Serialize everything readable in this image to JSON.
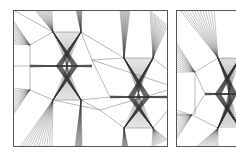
{
  "figure": {
    "colors": {
      "stroke": "#333333",
      "frame": "#555555",
      "background": "#ffffff"
    },
    "panels": [
      {
        "id": "left",
        "frame": [
          13,
          10,
          168,
          147
        ],
        "nodes": [
          {
            "name": "n_top_left_corner_fan",
            "x": 13,
            "y": 24
          },
          {
            "name": "n_a",
            "x": 30,
            "y": 45
          },
          {
            "name": "n_b",
            "x": 53,
            "y": 32
          },
          {
            "name": "n_c",
            "x": 81,
            "y": 32
          },
          {
            "name": "n_d",
            "x": 30,
            "y": 66
          },
          {
            "name": "n_e",
            "x": 92,
            "y": 60
          },
          {
            "name": "n_f",
            "x": 53,
            "y": 100
          },
          {
            "name": "n_g",
            "x": 81,
            "y": 100
          },
          {
            "name": "n_h",
            "x": 30,
            "y": 90
          },
          {
            "name": "n_i",
            "x": 110,
            "y": 97
          },
          {
            "name": "n_j",
            "x": 124,
            "y": 58
          },
          {
            "name": "n_k",
            "x": 153,
            "y": 58
          },
          {
            "name": "n_l",
            "x": 124,
            "y": 128
          },
          {
            "name": "n_m",
            "x": 153,
            "y": 128
          },
          {
            "name": "n_n",
            "x": 168,
            "y": 97
          },
          {
            "name": "n_o",
            "x": 100,
            "y": 110
          }
        ],
        "bowties": [
          {
            "center": [
              67,
              66
            ],
            "top": [
              [
                53,
                32
              ],
              [
                81,
                32
              ]
            ],
            "bottom": [
              [
                53,
                100
              ],
              [
                81,
                100
              ]
            ],
            "bar": [
              [
                30,
                66
              ],
              [
                92,
                66
              ]
            ]
          },
          {
            "center": [
              139,
              97
            ],
            "top": [
              [
                124,
                58
              ],
              [
                153,
                58
              ]
            ],
            "bottom": [
              [
                124,
                128
              ],
              [
                153,
                128
              ]
            ],
            "bar": [
              [
                110,
                97
              ],
              [
                168,
                97
              ]
            ]
          }
        ],
        "fans": [
          {
            "apex": [
              53,
              32
            ],
            "from": [
              [
                35,
                10
              ],
              [
                52,
                10
              ]
            ]
          },
          {
            "apex": [
              81,
              32
            ],
            "from": [
              [
                76,
                10
              ],
              [
                82,
                10
              ]
            ]
          },
          {
            "apex": [
              30,
              45
            ],
            "from": [
              [
                13,
                20
              ],
              [
                13,
                44
              ]
            ]
          },
          {
            "apex": [
              124,
              58
            ],
            "from": [
              [
                120,
                10
              ],
              [
                130,
                10
              ]
            ]
          },
          {
            "apex": [
              153,
              58
            ],
            "from": [
              [
                150,
                10
              ],
              [
                168,
                25
              ]
            ]
          },
          {
            "apex": [
              53,
              100
            ],
            "from": [
              [
                20,
                147
              ],
              [
                52,
                147
              ]
            ]
          },
          {
            "apex": [
              81,
              100
            ],
            "from": [
              [
                75,
                147
              ],
              [
                82,
                147
              ]
            ]
          },
          {
            "apex": [
              30,
              90
            ],
            "from": [
              [
                13,
                88
              ],
              [
                13,
                115
              ]
            ]
          },
          {
            "apex": [
              124,
              128
            ],
            "from": [
              [
                122,
                147
              ],
              [
                128,
                147
              ]
            ]
          },
          {
            "apex": [
              153,
              128
            ],
            "from": [
              [
                152,
                147
              ],
              [
                168,
                140
              ]
            ]
          }
        ],
        "edges": [
          [
            [
              13,
              10
            ],
            [
              53,
              32
            ]
          ],
          [
            [
              53,
              32
            ],
            [
              81,
              32
            ]
          ],
          [
            [
              81,
              32
            ],
            [
              92,
              60
            ]
          ],
          [
            [
              30,
              45
            ],
            [
              53,
              32
            ]
          ],
          [
            [
              30,
              45
            ],
            [
              30,
              66
            ]
          ],
          [
            [
              30,
              66
            ],
            [
              30,
              90
            ]
          ],
          [
            [
              30,
              90
            ],
            [
              53,
              100
            ]
          ],
          [
            [
              53,
              100
            ],
            [
              81,
              100
            ]
          ],
          [
            [
              81,
              100
            ],
            [
              110,
              97
            ]
          ],
          [
            [
              92,
              60
            ],
            [
              124,
              58
            ]
          ],
          [
            [
              124,
              58
            ],
            [
              153,
              58
            ]
          ],
          [
            [
              92,
              60
            ],
            [
              110,
              97
            ]
          ],
          [
            [
              81,
              32
            ],
            [
              124,
              58
            ]
          ],
          [
            [
              92,
              60
            ],
            [
              168,
              85
            ]
          ],
          [
            [
              81,
              100
            ],
            [
              100,
              110
            ]
          ],
          [
            [
              100,
              110
            ],
            [
              124,
              128
            ]
          ],
          [
            [
              124,
              128
            ],
            [
              153,
              128
            ]
          ],
          [
            [
              153,
              128
            ],
            [
              168,
              110
            ]
          ],
          [
            [
              153,
              58
            ],
            [
              168,
              70
            ]
          ],
          [
            [
              100,
              110
            ],
            [
              168,
              90
            ]
          ],
          [
            [
              30,
              66
            ],
            [
              13,
              66
            ]
          ],
          [
            [
              53,
              100
            ],
            [
              100,
              110
            ]
          ]
        ]
      },
      {
        "id": "right",
        "frame": [
          176,
          10,
          240,
          147
        ],
        "nodes": [
          {
            "name": "r_a",
            "x": 195,
            "y": 72
          },
          {
            "name": "r_b",
            "x": 218,
            "y": 58
          },
          {
            "name": "r_c",
            "x": 218,
            "y": 128
          },
          {
            "name": "r_d",
            "x": 205,
            "y": 94
          },
          {
            "name": "r_e",
            "x": 192,
            "y": 115
          }
        ],
        "bowties": [
          {
            "center": [
              226,
              94
            ],
            "top": [
              [
                218,
                58
              ],
              [
                240,
                58
              ]
            ],
            "bottom": [
              [
                218,
                128
              ],
              [
                240,
                128
              ]
            ],
            "bar": [
              [
                205,
                94
              ],
              [
                240,
                94
              ]
            ]
          }
        ],
        "fans": [
          {
            "apex": [
              218,
              58
            ],
            "from": [
              [
                180,
                10
              ],
              [
                214,
                10
              ]
            ]
          },
          {
            "apex": [
              195,
              72
            ],
            "from": [
              [
                176,
                42
              ],
              [
                176,
                72
              ]
            ]
          },
          {
            "apex": [
              192,
              115
            ],
            "from": [
              [
                176,
                110
              ],
              [
                176,
                140
              ]
            ]
          },
          {
            "apex": [
              218,
              128
            ],
            "from": [
              [
                196,
                147
              ],
              [
                218,
                147
              ]
            ]
          }
        ],
        "edges": [
          [
            [
              195,
              72
            ],
            [
              218,
              58
            ]
          ],
          [
            [
              195,
              72
            ],
            [
              205,
              94
            ]
          ],
          [
            [
              195,
              72
            ],
            [
              195,
              115
            ]
          ],
          [
            [
              205,
              94
            ],
            [
              192,
              115
            ]
          ],
          [
            [
              192,
              115
            ],
            [
              218,
              128
            ]
          ],
          [
            [
              218,
              58
            ],
            [
              240,
              58
            ]
          ],
          [
            [
              192,
              115
            ],
            [
              176,
              115
            ]
          ]
        ]
      }
    ]
  }
}
